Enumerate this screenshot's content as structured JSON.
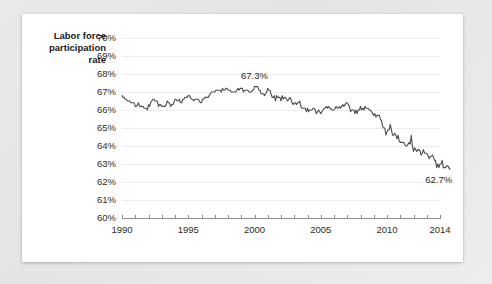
{
  "card": {
    "background_color": "#ffffff",
    "page_background_color": "#e8e8e8"
  },
  "axis_title": {
    "text": "Labor force\nparticipation\nrate"
  },
  "chart_data": {
    "type": "line",
    "title": "",
    "subtitle": "",
    "xlabel": "",
    "ylabel": "Labor force participation rate",
    "xlim": [
      1990,
      2014
    ],
    "ylim": [
      60,
      70
    ],
    "ytick_labels": [
      "70%",
      "69%",
      "68%",
      "67%",
      "66%",
      "65%",
      "64%",
      "63%",
      "62%",
      "61%",
      "60%"
    ],
    "ytick_values": [
      70,
      69,
      68,
      67,
      66,
      65,
      64,
      63,
      62,
      61,
      60
    ],
    "xtick_labels": [
      "1990",
      "1995",
      "2000",
      "2005",
      "2010",
      "2014"
    ],
    "xtick_values": [
      1990,
      1995,
      2000,
      2005,
      2010,
      2014
    ],
    "xtick_minor_values": [
      1990,
      1991,
      1992,
      1993,
      1994,
      1995,
      1996,
      1997,
      1998,
      1999,
      2000,
      2001,
      2002,
      2003,
      2004,
      2005,
      2006,
      2007,
      2008,
      2009,
      2010,
      2011,
      2012,
      2013,
      2014
    ],
    "grid": true,
    "grid_axis": "y",
    "legend": false,
    "line_color": "#4d4d4d",
    "grid_color": "#ededed",
    "axis_color": "#8e8e8e",
    "annotations": [
      {
        "label": "67.3%",
        "x": 2000.0,
        "y": 67.3,
        "position": "above"
      },
      {
        "label": "62.7%",
        "x": 2013.9,
        "y": 62.7,
        "position": "below"
      }
    ],
    "series": [
      {
        "name": "Labor force participation rate",
        "x": [
          1990.0,
          1990.083,
          1990.167,
          1990.25,
          1990.333,
          1990.417,
          1990.5,
          1990.583,
          1990.667,
          1990.75,
          1990.833,
          1990.917,
          1991.0,
          1991.083,
          1991.167,
          1991.25,
          1991.333,
          1991.417,
          1991.5,
          1991.583,
          1991.667,
          1991.75,
          1991.833,
          1991.917,
          1992.0,
          1992.083,
          1992.167,
          1992.25,
          1992.333,
          1992.417,
          1992.5,
          1992.583,
          1992.667,
          1992.75,
          1992.833,
          1992.917,
          1993.0,
          1993.083,
          1993.167,
          1993.25,
          1993.333,
          1993.417,
          1993.5,
          1993.583,
          1993.667,
          1993.75,
          1993.833,
          1993.917,
          1994.0,
          1994.083,
          1994.167,
          1994.25,
          1994.333,
          1994.417,
          1994.5,
          1994.583,
          1994.667,
          1994.75,
          1994.833,
          1994.917,
          1995.0,
          1995.083,
          1995.167,
          1995.25,
          1995.333,
          1995.417,
          1995.5,
          1995.583,
          1995.667,
          1995.75,
          1995.833,
          1995.917,
          1996.0,
          1996.083,
          1996.167,
          1996.25,
          1996.333,
          1996.417,
          1996.5,
          1996.583,
          1996.667,
          1996.75,
          1996.833,
          1996.917,
          1997.0,
          1997.083,
          1997.167,
          1997.25,
          1997.333,
          1997.417,
          1997.5,
          1997.583,
          1997.667,
          1997.75,
          1997.833,
          1997.917,
          1998.0,
          1998.083,
          1998.167,
          1998.25,
          1998.333,
          1998.417,
          1998.5,
          1998.583,
          1998.667,
          1998.75,
          1998.833,
          1998.917,
          1999.0,
          1999.083,
          1999.167,
          1999.25,
          1999.333,
          1999.417,
          1999.5,
          1999.583,
          1999.667,
          1999.75,
          1999.833,
          1999.917,
          2000.0,
          2000.083,
          2000.167,
          2000.25,
          2000.333,
          2000.417,
          2000.5,
          2000.583,
          2000.667,
          2000.75,
          2000.833,
          2000.917,
          2001.0,
          2001.083,
          2001.167,
          2001.25,
          2001.333,
          2001.417,
          2001.5,
          2001.583,
          2001.667,
          2001.75,
          2001.833,
          2001.917,
          2002.0,
          2002.083,
          2002.167,
          2002.25,
          2002.333,
          2002.417,
          2002.5,
          2002.583,
          2002.667,
          2002.75,
          2002.833,
          2002.917,
          2003.0,
          2003.083,
          2003.167,
          2003.25,
          2003.333,
          2003.417,
          2003.5,
          2003.583,
          2003.667,
          2003.75,
          2003.833,
          2003.917,
          2004.0,
          2004.083,
          2004.167,
          2004.25,
          2004.333,
          2004.417,
          2004.5,
          2004.583,
          2004.667,
          2004.75,
          2004.833,
          2004.917,
          2005.0,
          2005.083,
          2005.167,
          2005.25,
          2005.333,
          2005.417,
          2005.5,
          2005.583,
          2005.667,
          2005.75,
          2005.833,
          2005.917,
          2006.0,
          2006.083,
          2006.167,
          2006.25,
          2006.333,
          2006.417,
          2006.5,
          2006.583,
          2006.667,
          2006.75,
          2006.833,
          2006.917,
          2007.0,
          2007.083,
          2007.167,
          2007.25,
          2007.333,
          2007.417,
          2007.5,
          2007.583,
          2007.667,
          2007.75,
          2007.833,
          2007.917,
          2008.0,
          2008.083,
          2008.167,
          2008.25,
          2008.333,
          2008.417,
          2008.5,
          2008.583,
          2008.667,
          2008.75,
          2008.833,
          2008.917,
          2009.0,
          2009.083,
          2009.167,
          2009.25,
          2009.333,
          2009.417,
          2009.5,
          2009.583,
          2009.667,
          2009.75,
          2009.833,
          2009.917,
          2010.0,
          2010.083,
          2010.167,
          2010.25,
          2010.333,
          2010.417,
          2010.5,
          2010.583,
          2010.667,
          2010.75,
          2010.833,
          2010.917,
          2011.0,
          2011.083,
          2011.167,
          2011.25,
          2011.333,
          2011.417,
          2011.5,
          2011.583,
          2011.667,
          2011.75,
          2011.833,
          2011.917,
          2012.0,
          2012.083,
          2012.167,
          2012.25,
          2012.333,
          2012.417,
          2012.5,
          2012.583,
          2012.667,
          2012.75,
          2012.833,
          2012.917,
          2013.0,
          2013.083,
          2013.167,
          2013.25,
          2013.333,
          2013.417,
          2013.5,
          2013.583,
          2013.667,
          2013.75,
          2013.833,
          2013.917,
          2014.0,
          2014.083,
          2014.167,
          2014.25,
          2014.333,
          2014.417,
          2014.5,
          2014.583,
          2014.667,
          2014.75
        ],
        "values": [
          66.8,
          66.7,
          66.7,
          66.6,
          66.6,
          66.5,
          66.5,
          66.5,
          66.4,
          66.4,
          66.4,
          66.4,
          66.2,
          66.2,
          66.3,
          66.4,
          66.2,
          66.2,
          66.2,
          66.2,
          66.1,
          66.1,
          66.1,
          66.0,
          66.3,
          66.2,
          66.4,
          66.5,
          66.6,
          66.6,
          66.5,
          66.5,
          66.5,
          66.2,
          66.3,
          66.3,
          66.2,
          66.2,
          66.2,
          66.2,
          66.3,
          66.5,
          66.4,
          66.4,
          66.2,
          66.3,
          66.3,
          66.4,
          66.6,
          66.6,
          66.5,
          66.5,
          66.6,
          66.4,
          66.4,
          66.6,
          66.6,
          66.7,
          66.7,
          66.7,
          66.8,
          66.8,
          66.7,
          66.6,
          66.6,
          66.5,
          66.6,
          66.6,
          66.6,
          66.6,
          66.5,
          66.4,
          66.4,
          66.6,
          66.6,
          66.7,
          66.7,
          66.7,
          66.7,
          66.8,
          66.9,
          67.0,
          67.0,
          67.0,
          67.0,
          67.1,
          67.1,
          67.1,
          67.1,
          67.1,
          67.0,
          67.2,
          67.1,
          67.1,
          67.2,
          67.2,
          67.1,
          67.1,
          67.1,
          67.0,
          67.0,
          67.0,
          67.0,
          67.0,
          67.1,
          67.2,
          67.1,
          67.2,
          67.2,
          67.2,
          67.0,
          67.1,
          67.1,
          67.1,
          67.1,
          67.0,
          67.0,
          67.0,
          67.1,
          67.1,
          67.3,
          67.3,
          67.3,
          67.3,
          67.1,
          67.1,
          66.9,
          66.9,
          66.9,
          66.8,
          66.9,
          67.0,
          67.2,
          67.1,
          67.1,
          66.9,
          66.7,
          66.7,
          66.8,
          66.5,
          66.8,
          66.7,
          66.7,
          66.7,
          66.5,
          66.8,
          66.6,
          66.7,
          66.7,
          66.6,
          66.5,
          66.6,
          66.7,
          66.6,
          66.4,
          66.3,
          66.4,
          66.4,
          66.3,
          66.4,
          66.4,
          66.5,
          66.2,
          66.1,
          66.1,
          66.1,
          66.1,
          65.9,
          66.1,
          65.9,
          66.0,
          66.0,
          66.0,
          66.1,
          66.1,
          66.0,
          65.8,
          65.9,
          66.0,
          65.9,
          65.8,
          65.9,
          66.0,
          66.1,
          66.1,
          66.2,
          66.1,
          66.2,
          66.1,
          66.1,
          66.0,
          66.0,
          66.0,
          66.1,
          66.2,
          66.1,
          66.1,
          66.2,
          66.1,
          66.2,
          66.3,
          66.2,
          66.3,
          66.4,
          66.4,
          66.3,
          66.2,
          65.9,
          66.0,
          66.0,
          66.0,
          65.8,
          66.0,
          65.8,
          66.0,
          66.0,
          66.2,
          66.0,
          66.1,
          66.0,
          66.2,
          66.1,
          66.1,
          66.1,
          66.0,
          66.0,
          65.9,
          65.8,
          65.7,
          65.8,
          65.6,
          65.7,
          65.7,
          65.7,
          65.5,
          65.4,
          65.1,
          65.0,
          65.0,
          64.6,
          64.8,
          64.9,
          64.9,
          65.2,
          64.9,
          64.6,
          64.6,
          64.7,
          64.6,
          64.4,
          64.6,
          64.3,
          64.2,
          64.2,
          64.2,
          64.2,
          64.1,
          64.0,
          64.0,
          64.1,
          64.2,
          64.1,
          64.6,
          64.0,
          63.7,
          63.9,
          63.8,
          63.7,
          63.8,
          63.8,
          63.7,
          63.5,
          63.6,
          63.8,
          63.6,
          63.6,
          63.6,
          63.5,
          63.3,
          63.4,
          63.4,
          63.5,
          63.4,
          63.2,
          63.2,
          62.8,
          63.0,
          62.8,
          63.0,
          63.0,
          63.2,
          62.8,
          62.8,
          62.8,
          62.9,
          62.9,
          62.8,
          62.7
        ]
      }
    ]
  }
}
